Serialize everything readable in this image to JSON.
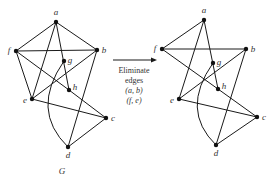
{
  "arrow": {
    "lines": [
      "Eliminate",
      "edges",
      "(a, b)",
      "(f, e)"
    ]
  },
  "graph_left": {
    "caption": "G",
    "vertices": [
      "a",
      "b",
      "c",
      "d",
      "e",
      "f",
      "g",
      "h"
    ],
    "edges": [
      [
        "a",
        "f"
      ],
      [
        "a",
        "b"
      ],
      [
        "a",
        "e"
      ],
      [
        "a",
        "h"
      ],
      [
        "f",
        "b"
      ],
      [
        "f",
        "e"
      ],
      [
        "f",
        "h"
      ],
      [
        "h",
        "c"
      ],
      [
        "e",
        "b"
      ],
      [
        "e",
        "c"
      ],
      [
        "b",
        "d"
      ],
      [
        "d",
        "c"
      ]
    ],
    "curved_edges": [
      [
        "g",
        "d"
      ]
    ]
  },
  "graph_right": {
    "caption": "",
    "vertices": [
      "a",
      "b",
      "c",
      "d",
      "e",
      "f",
      "g",
      "h"
    ],
    "edges": [
      [
        "a",
        "f"
      ],
      [
        "a",
        "e"
      ],
      [
        "a",
        "h"
      ],
      [
        "f",
        "b"
      ],
      [
        "f",
        "h"
      ],
      [
        "h",
        "c"
      ],
      [
        "e",
        "b"
      ],
      [
        "e",
        "c"
      ],
      [
        "b",
        "d"
      ],
      [
        "d",
        "c"
      ]
    ],
    "curved_edges": [
      [
        "g",
        "d"
      ]
    ]
  },
  "eliminated_edges": [
    [
      "a",
      "b"
    ],
    [
      "f",
      "e"
    ]
  ]
}
